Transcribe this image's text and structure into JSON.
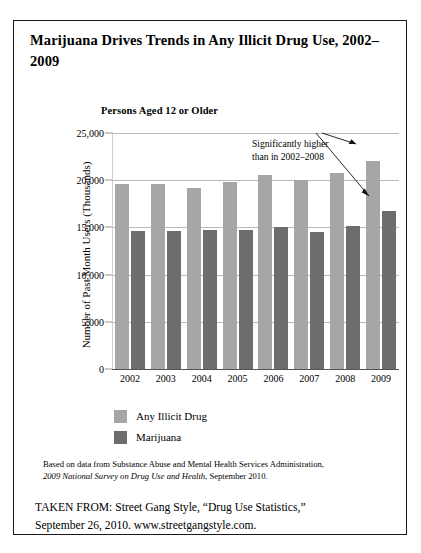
{
  "figure": {
    "title": "Marijuana Drives Trends in Any Illicit Drug Use, 2002–2009",
    "subtitle": "Persons Aged 12 or Older",
    "annotation": {
      "line1": "Significantly higher",
      "line2": "than in 2002–2008"
    },
    "source_note": {
      "line1": "Based on data from Substance Abuse and Mental Health Services Administration,",
      "line2_italic": "2009 National Survey on Drug Use and Health",
      "line2_rest": ", September 2010."
    },
    "taken_from": {
      "line1": "TAKEN FROM: Street Gang Style, “Drug Use Statistics,”",
      "line2": "September 26, 2010. www.streetgangstyle.com."
    }
  },
  "colors": {
    "any_illicit_drug": "#a6a6a6",
    "marijuana": "#6d6d6d",
    "gridline": "#b9b9b9",
    "axis": "#555555",
    "border": "#1a1a1a"
  },
  "chart_data": {
    "type": "bar",
    "title": "Marijuana Drives Trends in Any Illicit Drug Use, 2002–2009",
    "subtitle": "Persons Aged 12 or Older",
    "xlabel": "",
    "ylabel": "Number of Past Month Users (Thousands)",
    "categories": [
      "2002",
      "2003",
      "2004",
      "2005",
      "2006",
      "2007",
      "2008",
      "2009"
    ],
    "series": [
      {
        "name": "Any Illicit Drug",
        "color": "#a6a6a6",
        "values": [
          19600,
          19600,
          19200,
          19800,
          20600,
          20000,
          20800,
          22000
        ]
      },
      {
        "name": "Marijuana",
        "color": "#6d6d6d",
        "values": [
          14600,
          14600,
          14700,
          14700,
          15000,
          14500,
          15200,
          16700
        ]
      }
    ],
    "ylim": [
      0,
      25000
    ],
    "yticks": [
      0,
      5000,
      10000,
      15000,
      20000,
      25000
    ],
    "ytick_labels": [
      "0",
      "5,000",
      "10,000",
      "15,000",
      "20,000",
      "25,000"
    ],
    "grid": true,
    "legend_position": "below-axis-left",
    "annotations": [
      {
        "text": "Significantly higher than in 2002–2008",
        "points_to": [
          "2009 Any Illicit Drug",
          "2009 Marijuana"
        ]
      }
    ]
  }
}
